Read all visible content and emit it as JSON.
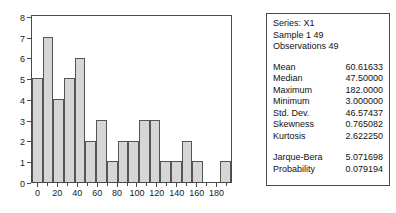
{
  "chart_data": {
    "type": "bar",
    "title": "",
    "subtitle": "",
    "xlabel": "",
    "ylabel": "",
    "xlim": [
      -5,
      195
    ],
    "ylim": [
      0,
      8
    ],
    "grid": false,
    "legend": null,
    "bin_width": 10,
    "bin_starts": [
      0,
      10,
      20,
      30,
      40,
      50,
      60,
      70,
      80,
      90,
      100,
      110,
      120,
      130,
      140,
      150,
      160,
      170,
      180
    ],
    "categories": [
      "0-10",
      "10-20",
      "20-30",
      "30-40",
      "40-50",
      "50-60",
      "60-70",
      "70-80",
      "80-90",
      "90-100",
      "100-110",
      "110-120",
      "120-130",
      "130-140",
      "140-150",
      "150-160",
      "160-170",
      "170-180",
      "180-190"
    ],
    "values": [
      5,
      7,
      4,
      5,
      6,
      2,
      3,
      1,
      2,
      2,
      3,
      3,
      1,
      1,
      2,
      1,
      0,
      0,
      1
    ],
    "x_ticks": [
      0,
      20,
      40,
      60,
      80,
      100,
      120,
      140,
      160,
      180
    ],
    "x_minor_ticks": [
      10,
      30,
      50,
      70,
      90,
      110,
      130,
      150,
      170,
      190
    ],
    "y_ticks": [
      0,
      1,
      2,
      3,
      4,
      5,
      6,
      7,
      8
    ],
    "colors": {
      "bar_fill": "#d6d6d6",
      "bar_edge": "#555555",
      "frame": "#4a4a4a",
      "text": "#111111"
    }
  },
  "stats": {
    "header": {
      "series": "Series: X1",
      "sample": "Sample 1 49",
      "observations": "Observations 49"
    },
    "rows": [
      {
        "name": "Mean",
        "value": "60.61633"
      },
      {
        "name": "Median",
        "value": "47.50000"
      },
      {
        "name": "Maximum",
        "value": "182.0000"
      },
      {
        "name": "Minimum",
        "value": "3.000000"
      },
      {
        "name": "Std. Dev.",
        "value": "46.57437"
      },
      {
        "name": "Skewness",
        "value": "0.765082"
      },
      {
        "name": "Kurtosis",
        "value": "2.622250"
      }
    ],
    "test_rows": [
      {
        "name": "Jarque-Bera",
        "value": "5.071698"
      },
      {
        "name": "Probability",
        "value": "0.079194"
      }
    ]
  }
}
